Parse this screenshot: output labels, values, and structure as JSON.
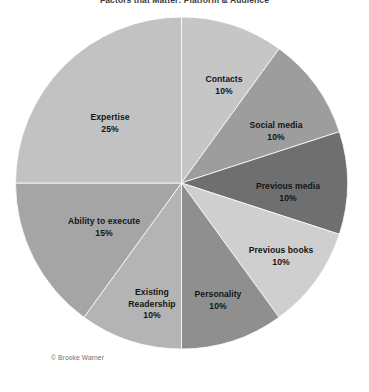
{
  "figure": {
    "title": "Factors that Matter: Platform & Audience",
    "credit": "© Brooke Warner"
  },
  "chart_data": {
    "type": "pie",
    "title": "Factors that Matter: Platform & Audience",
    "xlabel": "",
    "ylabel": "",
    "legend_position": "none",
    "grid": false,
    "start_angle_deg": 0,
    "direction": "clockwise",
    "units": "percent",
    "total": 100,
    "categories": [
      "Contacts",
      "Social media",
      "Previous media",
      "Previous books",
      "Personality",
      "Existing Readership",
      "Ability to execute",
      "Expertise"
    ],
    "values": [
      10,
      10,
      10,
      10,
      10,
      10,
      15,
      25
    ],
    "slices": [
      {
        "label": "Contacts",
        "value": 10,
        "value_text": "10%",
        "color": "#c6c6c6",
        "label_x": 224,
        "label_y": 85,
        "wrap": false
      },
      {
        "label": "Social media",
        "value": 10,
        "value_text": "10%",
        "color": "#9d9d9d",
        "label_x": 276,
        "label_y": 131,
        "wrap": false
      },
      {
        "label": "Previous media",
        "value": 10,
        "value_text": "10%",
        "color": "#6f6f6f",
        "label_x": 288,
        "label_y": 192,
        "wrap": false
      },
      {
        "label": "Previous books",
        "value": 10,
        "value_text": "10%",
        "color": "#cfcfcf",
        "label_x": 281,
        "label_y": 256,
        "wrap": false
      },
      {
        "label": "Personality",
        "value": 10,
        "value_text": "10%",
        "color": "#8f8f8f",
        "label_x": 218,
        "label_y": 300,
        "wrap": false
      },
      {
        "label": "Existing Readership",
        "value": 10,
        "value_text": "10%",
        "color": "#b4b4b4",
        "label_x": 152,
        "label_y": 304,
        "wrap": true
      },
      {
        "label": "Ability to execute",
        "value": 15,
        "value_text": "15%",
        "color": "#a5a5a5",
        "label_x": 104,
        "label_y": 227,
        "wrap": false
      },
      {
        "label": "Expertise",
        "value": 25,
        "value_text": "25%",
        "color": "#c2c2c2",
        "label_x": 110,
        "label_y": 123,
        "wrap": false
      }
    ],
    "geometry": {
      "cx": 181.5,
      "cy": 183,
      "r": 166
    },
    "background": "#ffffff",
    "slice_border_color": "#ffffff"
  }
}
